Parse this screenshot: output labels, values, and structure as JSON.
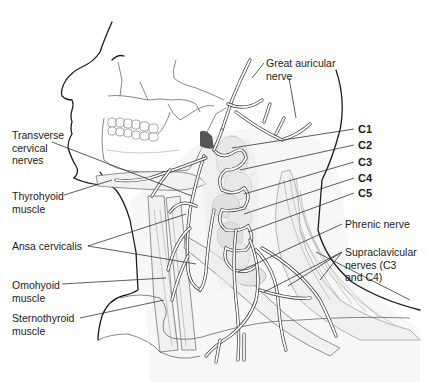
{
  "figure": {
    "labels_left": [
      {
        "id": "transverse-cervical-nerves",
        "text": "Transverse\ncervical\nnerves"
      },
      {
        "id": "thyrohyoid-muscle",
        "text": "Thyrohyoid\nmuscle"
      },
      {
        "id": "ansa-cervicalis",
        "text": "Ansa cervicalis"
      },
      {
        "id": "omohyoid-muscle",
        "text": "Omohyoid\nmuscle"
      },
      {
        "id": "sternothyroid-muscle",
        "text": "Sternothyroid\nmuscle"
      }
    ],
    "labels_right": [
      {
        "id": "great-auricular-nerve",
        "text": "Great auricular\nnerve"
      },
      {
        "id": "c1",
        "text": "C1"
      },
      {
        "id": "c2",
        "text": "C2"
      },
      {
        "id": "c3",
        "text": "C3"
      },
      {
        "id": "c4",
        "text": "C4"
      },
      {
        "id": "c5",
        "text": "C5"
      },
      {
        "id": "phrenic-nerve",
        "text": "Phrenic nerve"
      },
      {
        "id": "supraclavicular-nerves",
        "text": "Supraclavicular\nnerves (C3\nand C4)"
      }
    ]
  }
}
